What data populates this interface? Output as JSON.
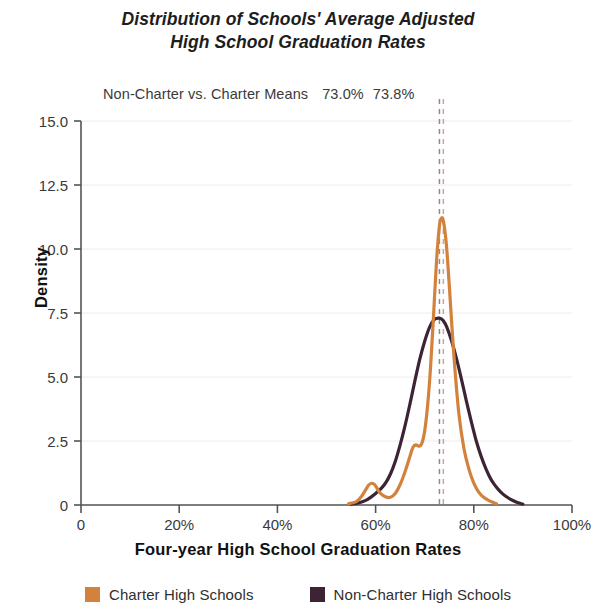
{
  "title": {
    "line1": "Distribution of Schools' Average Adjusted",
    "line2": "High School Graduation Rates"
  },
  "annotation": {
    "label": "Non-Charter vs. Charter Means",
    "non_charter_mean": "73.0%",
    "charter_mean": "73.8%"
  },
  "legend": {
    "items": [
      {
        "label": "Charter High Schools",
        "color": "#D3823C"
      },
      {
        "label": "Non-Charter High Schools",
        "color": "#3D2435"
      }
    ]
  },
  "chart_data": {
    "type": "line",
    "title": "Distribution of Schools' Average Adjusted High School Graduation Rates",
    "subtitle": "Non-Charter vs. Charter Means  73.0%  73.8%",
    "xlabel": "Four-year High School Graduation Rates",
    "ylabel": "Density",
    "xlim": [
      0,
      100
    ],
    "ylim": [
      0,
      15
    ],
    "xticks": [
      0,
      20,
      40,
      60,
      80,
      100
    ],
    "xticklabels": [
      "0",
      "20%",
      "40%",
      "60%",
      "80%",
      "100%"
    ],
    "yticks": [
      0,
      2.5,
      5,
      7.5,
      10,
      12.5,
      15
    ],
    "yticklabels": [
      "0",
      "2.5",
      "5.0",
      "7.5",
      "10.0",
      "12.5",
      "15.0"
    ],
    "grid": "horizontal",
    "legend_position": "bottom",
    "annotations": [
      {
        "type": "vline",
        "label": "Non-Charter mean",
        "x": 73.0,
        "style": "dashed",
        "color": "#8c8c8c"
      },
      {
        "type": "vline",
        "label": "Charter mean",
        "x": 73.8,
        "style": "dashed",
        "color": "#D3A0A0"
      }
    ],
    "series": [
      {
        "name": "Charter High Schools",
        "color": "#D3823C",
        "x": [
          54.5,
          56,
          57,
          58,
          58.6,
          59.2,
          59.8,
          60.4,
          61,
          62,
          63,
          64,
          65,
          66,
          67,
          67.6,
          68.2,
          68.8,
          69.4,
          70,
          70.6,
          71.2,
          71.8,
          72.4,
          73,
          73.4,
          73.8,
          74.4,
          75,
          75.6,
          76.2,
          77,
          78,
          79,
          80,
          81,
          82,
          83,
          84,
          84.6
        ],
        "y": [
          0.05,
          0.12,
          0.3,
          0.6,
          0.78,
          0.85,
          0.8,
          0.62,
          0.45,
          0.32,
          0.3,
          0.45,
          0.8,
          1.3,
          1.9,
          2.25,
          2.35,
          2.3,
          2.4,
          2.9,
          3.9,
          5.4,
          7.4,
          9.5,
          10.9,
          11.2,
          11.1,
          10.2,
          8.6,
          6.8,
          5.2,
          3.5,
          2.2,
          1.4,
          0.85,
          0.5,
          0.3,
          0.18,
          0.1,
          0.05
        ]
      },
      {
        "name": "Non-Charter High Schools",
        "color": "#3D2435",
        "x": [
          55,
          56.5,
          58,
          59,
          60,
          61,
          62,
          63,
          64,
          65,
          66,
          67,
          68,
          69,
          70,
          71,
          72,
          73,
          73.8,
          74.5,
          75.5,
          76.5,
          77.5,
          78.5,
          79.5,
          80.5,
          81.5,
          82.5,
          83.5,
          84.5,
          85.5,
          86.5,
          87.5,
          88.5,
          89.5,
          90
        ],
        "y": [
          0.03,
          0.08,
          0.18,
          0.3,
          0.45,
          0.62,
          0.85,
          1.2,
          1.7,
          2.35,
          3.1,
          3.95,
          4.85,
          5.7,
          6.4,
          6.95,
          7.25,
          7.3,
          7.2,
          6.95,
          6.4,
          5.7,
          4.9,
          4.05,
          3.25,
          2.5,
          1.9,
          1.4,
          1.0,
          0.72,
          0.5,
          0.34,
          0.22,
          0.13,
          0.06,
          0.03
        ]
      }
    ]
  }
}
